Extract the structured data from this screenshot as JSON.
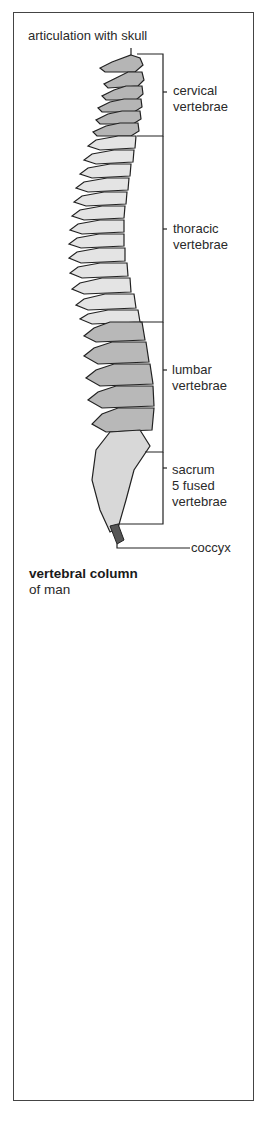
{
  "diagram": {
    "title": "vertebral column",
    "subtitle": "of man",
    "labels": {
      "articulation": "articulation with skull",
      "cervical": "cervical\nvertebrae",
      "thoracic": "thoracic\nvertebrae",
      "lumbar": "lumbar\nvertebrae",
      "sacrum": "sacrum\n5 fused\nvertebrae",
      "coccyx": "coccyx"
    },
    "regions": [
      {
        "name": "cervical",
        "fill": "#b5b5b5"
      },
      {
        "name": "thoracic",
        "fill": "#e4e4e4"
      },
      {
        "name": "lumbar",
        "fill": "#b8b8b8"
      },
      {
        "name": "sacrum",
        "fill": "#d8d8d8"
      },
      {
        "name": "coccyx",
        "fill": "#555555"
      }
    ]
  }
}
